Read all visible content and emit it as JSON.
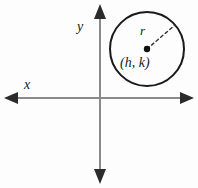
{
  "figure": {
    "background_color": "#fdfdfd",
    "width": 198,
    "height": 188
  },
  "axes": {
    "color": "#8a8a8a",
    "stroke_width": 2,
    "origin": {
      "x": 100,
      "y": 98
    },
    "x_axis": {
      "label": "x",
      "label_position": {
        "x": 24,
        "y": 78
      },
      "from": {
        "x": 6,
        "y": 98
      },
      "to": {
        "x": 192,
        "y": 98
      },
      "arrowheads": [
        "left",
        "right"
      ]
    },
    "y_axis": {
      "label": "y",
      "label_position": {
        "x": 77,
        "y": 20
      },
      "from": {
        "x": 100,
        "y": 182
      },
      "to": {
        "x": 100,
        "y": 6
      },
      "arrowheads": [
        "up",
        "down"
      ]
    }
  },
  "circle": {
    "color": "#1a1a1a",
    "stroke_width": 2,
    "center": {
      "x": 147,
      "y": 49
    },
    "radius": 37,
    "center_dot": {
      "name": "center-point",
      "radius": 3,
      "color": "#111111"
    },
    "center_label": "(h, k)",
    "radius_label": "r",
    "radius_line": {
      "style": "dashed",
      "color": "#333333",
      "from": {
        "x": 147,
        "y": 49
      },
      "to": {
        "x": 175,
        "y": 25
      }
    }
  },
  "labels": {
    "x": "x",
    "y": "y",
    "r": "r",
    "center": "(h, k)"
  }
}
